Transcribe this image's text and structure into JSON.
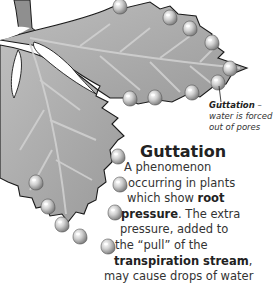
{
  "figure": {
    "callout": {
      "term": "Guttation",
      "dash": " –",
      "description_lines": [
        "water is forced",
        "out of pores"
      ]
    },
    "title": "Guttation",
    "body_lines": [
      {
        "parts": [
          {
            "text": "A phenomenon",
            "bold": false
          }
        ]
      },
      {
        "parts": [
          {
            "text": "occurring in plants",
            "bold": false
          }
        ]
      },
      {
        "parts": [
          {
            "text": "which show ",
            "bold": false
          },
          {
            "text": "root",
            "bold": true
          }
        ]
      },
      {
        "parts": [
          {
            "text": "pressure",
            "bold": true
          },
          {
            "text": ". The extra",
            "bold": false
          }
        ]
      },
      {
        "parts": [
          {
            "text": "pressure, added to",
            "bold": false
          }
        ]
      },
      {
        "parts": [
          {
            "text": "the “pull” of the",
            "bold": false
          }
        ]
      },
      {
        "parts": [
          {
            "text": "transpiration stream",
            "bold": true
          },
          {
            "text": ",",
            "bold": false
          }
        ]
      },
      {
        "parts": [
          {
            "text": "may cause drops of water",
            "bold": false
          }
        ]
      }
    ],
    "colors": {
      "leaf_fill": "#a9a9a9",
      "leaf_outline": "#1a1a1a",
      "vein": "#cfcfcf",
      "droplet": "#d8d8d8"
    }
  }
}
